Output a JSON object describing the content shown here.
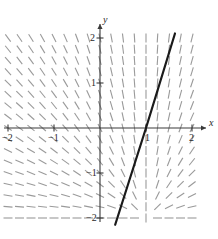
{
  "figure": {
    "kind": "slope-field-with-solution",
    "axis_labels": {
      "x": "x",
      "y": "y"
    },
    "colors": {
      "axis": "#3a3a3a",
      "slope_mark": "#9a9a9a",
      "solution_line": "#1a1a1a",
      "background": "#ffffff"
    }
  },
  "chart_data": {
    "type": "scatter",
    "title": "",
    "subtitle": "",
    "xlabel": "x",
    "ylabel": "y",
    "xlim": [
      -2,
      2
    ],
    "ylim": [
      -2,
      2
    ],
    "grid": false,
    "legend": null,
    "xticks": [
      -2,
      -1,
      1,
      2
    ],
    "yticks": [
      -2,
      -1,
      1,
      2
    ],
    "xticklabels": [
      "−2",
      "−1",
      "1",
      "2"
    ],
    "yticklabels": [
      "−2",
      "−1",
      "1",
      "2"
    ],
    "annotations": [],
    "slope_field": {
      "description": "short tangent dashes on a regular grid",
      "x_values": [
        -2.0,
        -1.75,
        -1.5,
        -1.25,
        -1.0,
        -0.75,
        -0.5,
        -0.25,
        0.0,
        0.25,
        0.5,
        0.75,
        1.0,
        1.25,
        1.5,
        1.75,
        2.0
      ],
      "y_values": [
        2.0,
        1.75,
        1.5,
        1.25,
        1.0,
        0.75,
        0.5,
        0.25,
        0.0,
        -0.25,
        -0.5,
        -0.75,
        -1.0,
        -1.25,
        -1.5,
        -1.75,
        -2.0
      ],
      "slope_formula": "dy/dx = (y + 2) / (x - 1)",
      "mark_length_px": 9,
      "mark_color": "#9a9a9a"
    },
    "series": [
      {
        "name": "solution curve",
        "type": "line",
        "color": "#1a1a1a",
        "linewidth": 2.2,
        "equation": "y = 3.2 (x - 1)",
        "x": [
          0.33,
          1.0,
          1.63
        ],
        "y": [
          -2.15,
          0.0,
          2.1
        ]
      }
    ]
  }
}
